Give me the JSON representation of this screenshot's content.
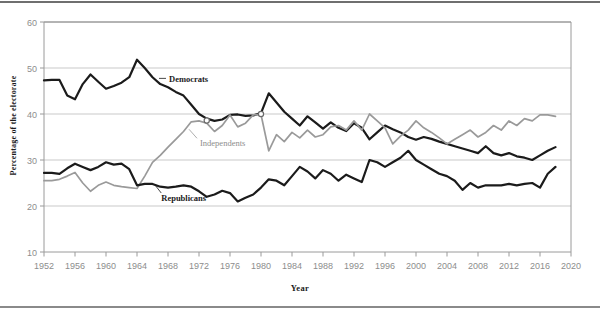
{
  "chart_data": {
    "type": "line",
    "title": "",
    "subtitle": "",
    "xlabel": "Year",
    "ylabel": "Percentage of the electorate",
    "xlim": [
      1952,
      2020
    ],
    "ylim": [
      10,
      60
    ],
    "xticks": [
      1952,
      1956,
      1960,
      1964,
      1968,
      1972,
      1976,
      1980,
      1984,
      1988,
      1992,
      1996,
      2000,
      2004,
      2008,
      2012,
      2016,
      2020
    ],
    "yticks": [
      10,
      20,
      30,
      40,
      50,
      60
    ],
    "xtick_labels": [
      "1952",
      "1956",
      "1960",
      "1964",
      "1968",
      "1972",
      "1976",
      "1980",
      "1984",
      "1988",
      "1992",
      "1996",
      "2000",
      "2004",
      "2008",
      "2012",
      "2016",
      "2020"
    ],
    "ytick_labels": [
      "10",
      "20",
      "30",
      "40",
      "50",
      "60"
    ],
    "grid": "horizontal",
    "legend_position": "inline-annotations",
    "series": [
      {
        "name": "Democrats",
        "color": "#1b1b1b",
        "label_x": 1968,
        "label_y": 47.2,
        "x": [
          1952,
          1953,
          1954,
          1955,
          1956,
          1957,
          1958,
          1959,
          1960,
          1961,
          1962,
          1963,
          1964,
          1965,
          1966,
          1967,
          1968,
          1969,
          1970,
          1971,
          1972,
          1973,
          1974,
          1975,
          1976,
          1977,
          1978,
          1979,
          1980,
          1981,
          1982,
          1983,
          1984,
          1985,
          1986,
          1987,
          1988,
          1989,
          1990,
          1991,
          1992,
          1993,
          1994,
          1995,
          1996,
          1997,
          1998,
          1999,
          2000,
          2001,
          2002,
          2003,
          2004,
          2005,
          2006,
          2007,
          2008,
          2009,
          2010,
          2011,
          2012,
          2013,
          2014,
          2015,
          2016,
          2017,
          2018
        ],
        "y": [
          47.3,
          47.4,
          47.4,
          44.0,
          43.2,
          46.5,
          48.6,
          47.0,
          45.5,
          46.1,
          46.8,
          48.0,
          51.8,
          50.0,
          48.0,
          46.5,
          45.8,
          44.8,
          44.0,
          42.0,
          40.0,
          39.0,
          38.5,
          38.8,
          39.8,
          39.9,
          39.6,
          39.7,
          40.2,
          44.5,
          42.5,
          40.5,
          39.0,
          37.5,
          39.5,
          38.2,
          36.8,
          38.2,
          37.0,
          36.3,
          38.0,
          37.0,
          34.5,
          36.0,
          37.5,
          36.7,
          36.0,
          35.0,
          34.4,
          35.0,
          34.6,
          34.0,
          33.5,
          33.0,
          32.5,
          32.0,
          31.5,
          33.0,
          31.5,
          31.0,
          31.5,
          30.8,
          30.5,
          30.0,
          31.0,
          32.0,
          32.8
        ]
      },
      {
        "name": "Independents",
        "color": "#9a9a9a",
        "label_x": 1972,
        "label_y": 33.2,
        "x": [
          1952,
          1953,
          1954,
          1955,
          1956,
          1957,
          1958,
          1959,
          1960,
          1961,
          1962,
          1963,
          1964,
          1965,
          1966,
          1967,
          1968,
          1969,
          1970,
          1971,
          1972,
          1973,
          1974,
          1975,
          1976,
          1977,
          1978,
          1979,
          1980,
          1981,
          1982,
          1983,
          1984,
          1985,
          1986,
          1987,
          1988,
          1989,
          1990,
          1991,
          1992,
          1993,
          1994,
          1995,
          1996,
          1997,
          1998,
          1999,
          2000,
          2001,
          2002,
          2003,
          2004,
          2005,
          2006,
          2007,
          2008,
          2009,
          2010,
          2011,
          2012,
          2013,
          2014,
          2015,
          2016,
          2017,
          2018
        ],
        "y": [
          25.5,
          25.5,
          25.8,
          26.5,
          27.3,
          25.0,
          23.2,
          24.5,
          25.2,
          24.5,
          24.2,
          24.0,
          23.8,
          26.5,
          29.5,
          31.0,
          32.8,
          34.5,
          36.2,
          38.3,
          38.5,
          38.0,
          36.2,
          37.5,
          39.8,
          37.2,
          38.0,
          39.8,
          39.9,
          32.0,
          35.5,
          34.0,
          36.0,
          34.8,
          36.5,
          35.0,
          35.5,
          37.2,
          37.5,
          36.5,
          38.5,
          36.5,
          40.0,
          38.5,
          37.0,
          33.5,
          35.2,
          36.5,
          38.5,
          37.0,
          36.0,
          34.8,
          33.5,
          34.5,
          35.5,
          36.5,
          35.0,
          36.0,
          37.5,
          36.5,
          38.5,
          37.5,
          39.0,
          38.5,
          39.8,
          39.8,
          39.5
        ]
      },
      {
        "name": "Republicans",
        "color": "#1b1b1b",
        "label_x": 1967,
        "label_y": 21.3,
        "x": [
          1952,
          1953,
          1954,
          1955,
          1956,
          1957,
          1958,
          1959,
          1960,
          1961,
          1962,
          1963,
          1964,
          1965,
          1966,
          1967,
          1968,
          1969,
          1970,
          1971,
          1972,
          1973,
          1974,
          1975,
          1976,
          1977,
          1978,
          1979,
          1980,
          1981,
          1982,
          1983,
          1984,
          1985,
          1986,
          1987,
          1988,
          1989,
          1990,
          1991,
          1992,
          1993,
          1994,
          1995,
          1996,
          1997,
          1998,
          1999,
          2000,
          2001,
          2002,
          2003,
          2004,
          2005,
          2006,
          2007,
          2008,
          2009,
          2010,
          2011,
          2012,
          2013,
          2014,
          2015,
          2016,
          2017,
          2018
        ],
        "y": [
          27.2,
          27.2,
          27.0,
          28.2,
          29.2,
          28.5,
          27.8,
          28.5,
          29.5,
          29.0,
          29.2,
          28.0,
          24.5,
          24.8,
          24.8,
          24.2,
          24.0,
          24.2,
          24.5,
          24.2,
          23.2,
          22.0,
          22.5,
          23.3,
          22.8,
          21.0,
          21.8,
          22.5,
          24.0,
          25.8,
          25.5,
          24.5,
          26.5,
          28.5,
          27.5,
          26.0,
          27.8,
          27.0,
          25.5,
          26.8,
          26.0,
          25.2,
          30.0,
          29.5,
          28.5,
          29.5,
          30.5,
          32.0,
          30.0,
          29.0,
          28.0,
          27.0,
          26.5,
          25.5,
          23.5,
          25.0,
          24.0,
          24.5,
          24.5,
          24.5,
          24.8,
          24.5,
          24.8,
          25.0,
          24.0,
          27.0,
          28.5
        ]
      }
    ]
  },
  "axis": {
    "frame_color": "#9a9a9a",
    "gridline_color": "#c9c9c9",
    "tick_color": "#9a9a9a"
  }
}
